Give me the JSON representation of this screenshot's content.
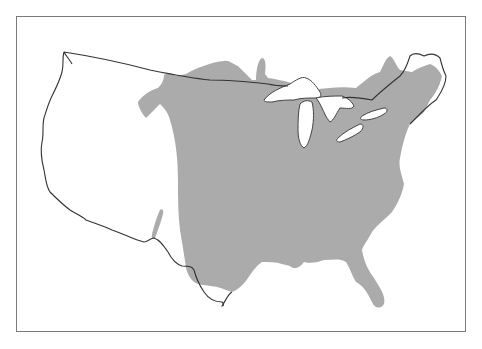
{
  "map": {
    "title": "",
    "subject": "Contiguous United States outline with shaded range region",
    "colors": {
      "background": "#ffffff",
      "frame": "#7a7a7a",
      "outline": "#333333",
      "range_fill": "#ababab",
      "water": "#ffffff"
    },
    "features": [
      {
        "id": "us-outline",
        "label": "Contiguous US border / coastline"
      },
      {
        "id": "range-region",
        "label": "Shaded range (eastern & central US, extending into southern Canada)"
      },
      {
        "id": "great-lakes",
        "label": "Great Lakes"
      },
      {
        "id": "texas-isolated-patch",
        "label": "Small isolated shaded patch in West Texas / New Mexico"
      }
    ]
  }
}
